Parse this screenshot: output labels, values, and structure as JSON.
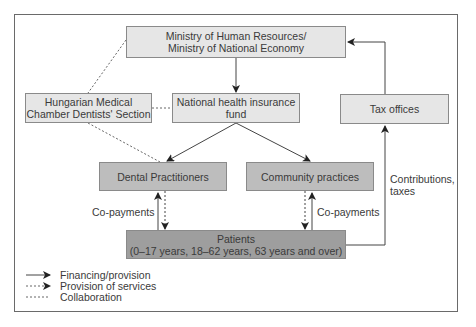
{
  "nodes": {
    "ministry": "Ministry of Human Resources/\nMinistry of National Economy",
    "ministry_l1": "Ministry of Human Resources/",
    "ministry_l2": "Ministry of National Economy",
    "chamber_l1": "Hungarian Medical",
    "chamber_l2": "Chamber Dentists' Section",
    "nhif_l1": "National health insurance",
    "nhif_l2": "fund",
    "tax": "Tax offices",
    "dental": "Dental Practitioners",
    "community": "Community practices",
    "patients_l1": "Patients",
    "patients_l2": "(0–17 years, 18–62 years, 63 years and over)"
  },
  "edge_labels": {
    "copay_left": "Co-payments",
    "copay_right": "Co-payments",
    "contrib_l1": "Contributions,",
    "contrib_l2": "taxes"
  },
  "legend": [
    {
      "style": "solid-arrow",
      "label": "Financing/provision"
    },
    {
      "style": "dotted-arrow",
      "label": "Provision of services"
    },
    {
      "style": "dotted-line",
      "label": "Collaboration"
    }
  ],
  "colors": {
    "light_box": "#e6e6e6",
    "mid_box": "#bdbdbd",
    "dark_box": "#9e9e9e",
    "line": "#444444"
  }
}
